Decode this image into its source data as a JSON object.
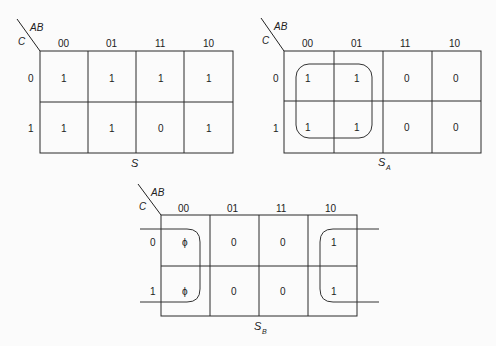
{
  "maps": [
    {
      "id": "S",
      "caption": "S",
      "caption_sub": "",
      "row_var": "C",
      "col_var": "AB",
      "col_headers": [
        "00",
        "01",
        "11",
        "10"
      ],
      "row_headers": [
        "0",
        "1"
      ],
      "cells": [
        [
          "1",
          "1",
          "1",
          "1"
        ],
        [
          "1",
          "1",
          "0",
          "1"
        ]
      ],
      "groups": []
    },
    {
      "id": "S_A",
      "caption": "S",
      "caption_sub": "A",
      "row_var": "C",
      "col_var": "AB",
      "col_headers": [
        "00",
        "01",
        "11",
        "10"
      ],
      "row_headers": [
        "0",
        "1"
      ],
      "cells": [
        [
          "1",
          "1",
          "0",
          "0"
        ],
        [
          "1",
          "1",
          "0",
          "0"
        ]
      ],
      "groups": [
        "quad AB=00,01 (C=0,1)"
      ]
    },
    {
      "id": "S_B",
      "caption": "S",
      "caption_sub": "B",
      "row_var": "C",
      "col_var": "AB",
      "col_headers": [
        "00",
        "01",
        "11",
        "10"
      ],
      "row_headers": [
        "0",
        "1"
      ],
      "cells": [
        [
          "ϕ",
          "0",
          "0",
          "1"
        ],
        [
          "ϕ",
          "0",
          "0",
          "1"
        ]
      ],
      "groups": [
        "wrap-around pair AB=00 and AB=10 (C=0,1)"
      ]
    }
  ]
}
